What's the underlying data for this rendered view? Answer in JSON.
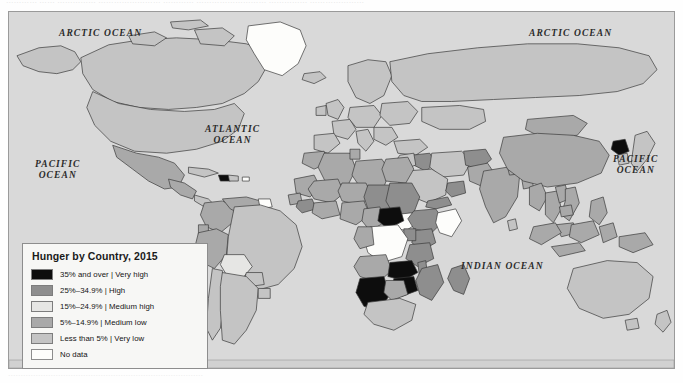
{
  "page": {
    "top_cut_text": "…………  ……  ……………  ……………………  …………  ………………………  ……………  …………………",
    "bottom_cut_text": "……………………………………………………………………"
  },
  "map": {
    "background_color": "#d9d9d9",
    "border_color": "#9a9a9a",
    "country_outline_color": "#3a3a3a",
    "ocean_labels": [
      {
        "name": "arctic-ocean-left",
        "text": "ARCTIC OCEAN",
        "x": 50,
        "y": 16
      },
      {
        "name": "arctic-ocean-right",
        "text": "ARCTIC OCEAN",
        "x": 520,
        "y": 16
      },
      {
        "name": "atlantic-ocean",
        "text": "ATLANTIC\nOCEAN",
        "x": 196,
        "y": 112
      },
      {
        "name": "pacific-ocean-left",
        "text": "PACIFIC\nOCEAN",
        "x": 26,
        "y": 147
      },
      {
        "name": "pacific-ocean-right",
        "text": "PACIFIC\nOCEAN",
        "x": 604,
        "y": 142
      },
      {
        "name": "indian-ocean",
        "text": "INDIAN OCEAN",
        "x": 452,
        "y": 249
      }
    ]
  },
  "legend": {
    "title": "Hunger by Country, 2015",
    "items": [
      {
        "label": "35% and over | Very high",
        "color": "#0d0d0d",
        "class_name": "very-high"
      },
      {
        "label": "25%–34.9% | High",
        "color": "#8e8e8e",
        "class_name": "high"
      },
      {
        "label": "15%–24.9% | Medium high",
        "color": "#e6e6e4",
        "class_name": "medium-high"
      },
      {
        "label": "5%–14.9% | Medium low",
        "color": "#a9a9a9",
        "class_name": "medium-low"
      },
      {
        "label": "Less than 5% | Very low",
        "color": "#c4c4c4",
        "class_name": "very-low"
      },
      {
        "label": "No data",
        "color": "#fdfdfb",
        "class_name": "no-data"
      }
    ]
  },
  "chart_data": {
    "type": "map",
    "title": "Hunger by Country, 2015",
    "measure": "Prevalence of undernourishment (share of population)",
    "categories": [
      "35% and over | Very high",
      "25%–34.9% | High",
      "15%–24.9% | Medium high",
      "5%–14.9% | Medium low",
      "Less than 5% | Very low",
      "No data"
    ],
    "category_colors": [
      "#0d0d0d",
      "#8e8e8e",
      "#e6e6e4",
      "#a9a9a9",
      "#c4c4c4",
      "#fdfdfb"
    ],
    "regions": [
      {
        "name": "Canada",
        "category": "Less than 5% | Very low"
      },
      {
        "name": "United States",
        "category": "Less than 5% | Very low"
      },
      {
        "name": "Greenland",
        "category": "No data"
      },
      {
        "name": "Mexico",
        "category": "5%–14.9% | Medium low"
      },
      {
        "name": "Guatemala",
        "category": "5%–14.9% | Medium low"
      },
      {
        "name": "Haiti",
        "category": "35% and over | Very high"
      },
      {
        "name": "Cuba",
        "category": "Less than 5% | Very low"
      },
      {
        "name": "Colombia",
        "category": "5%–14.9% | Medium low"
      },
      {
        "name": "Venezuela",
        "category": "5%–14.9% | Medium low"
      },
      {
        "name": "Peru",
        "category": "5%–14.9% | Medium low"
      },
      {
        "name": "Bolivia",
        "category": "15%–24.9% | Medium high"
      },
      {
        "name": "Brazil",
        "category": "Less than 5% | Very low"
      },
      {
        "name": "Argentina",
        "category": "Less than 5% | Very low"
      },
      {
        "name": "Chile",
        "category": "Less than 5% | Very low"
      },
      {
        "name": "Guyana",
        "category": "No data"
      },
      {
        "name": "Western Europe",
        "category": "Less than 5% | Very low"
      },
      {
        "name": "Russia",
        "category": "Less than 5% | Very low"
      },
      {
        "name": "Morocco",
        "category": "5%–14.9% | Medium low"
      },
      {
        "name": "Algeria",
        "category": "5%–14.9% | Medium low"
      },
      {
        "name": "Libya",
        "category": "5%–14.9% | Medium low"
      },
      {
        "name": "Egypt",
        "category": "5%–14.9% | Medium low"
      },
      {
        "name": "Sudan",
        "category": "25%–34.9% | High"
      },
      {
        "name": "Mali",
        "category": "5%–14.9% | Medium low"
      },
      {
        "name": "Niger",
        "category": "5%–14.9% | Medium low"
      },
      {
        "name": "Chad",
        "category": "25%–34.9% | High"
      },
      {
        "name": "Nigeria",
        "category": "5%–14.9% | Medium low"
      },
      {
        "name": "Ethiopia",
        "category": "25%–34.9% | High"
      },
      {
        "name": "Somalia",
        "category": "No data"
      },
      {
        "name": "Kenya",
        "category": "25%–34.9% | High"
      },
      {
        "name": "Uganda",
        "category": "25%–34.9% | High"
      },
      {
        "name": "Tanzania",
        "category": "25%–34.9% | High"
      },
      {
        "name": "Central African Republic",
        "category": "35% and over | Very high"
      },
      {
        "name": "Democratic Republic of the Congo",
        "category": "No data"
      },
      {
        "name": "Angola",
        "category": "5%–14.9% | Medium low"
      },
      {
        "name": "Zambia",
        "category": "35% and over | Very high"
      },
      {
        "name": "Zimbabwe",
        "category": "35% and over | Very high"
      },
      {
        "name": "Namibia",
        "category": "35% and over | Very high"
      },
      {
        "name": "Mozambique",
        "category": "25%–34.9% | High"
      },
      {
        "name": "Madagascar",
        "category": "25%–34.9% | High"
      },
      {
        "name": "South Africa",
        "category": "Less than 5% | Very low"
      },
      {
        "name": "Saudi Arabia",
        "category": "Less than 5% | Very low"
      },
      {
        "name": "Yemen",
        "category": "25%–34.9% | High"
      },
      {
        "name": "Iraq",
        "category": "25%–34.9% | High"
      },
      {
        "name": "Iran",
        "category": "Less than 5% | Very low"
      },
      {
        "name": "Afghanistan",
        "category": "25%–34.9% | High"
      },
      {
        "name": "Pakistan",
        "category": "5%–14.9% | Medium low"
      },
      {
        "name": "India",
        "category": "5%–14.9% | Medium low"
      },
      {
        "name": "China",
        "category": "5%–14.9% | Medium low"
      },
      {
        "name": "Mongolia",
        "category": "5%–14.9% | Medium low"
      },
      {
        "name": "North Korea",
        "category": "35% and over | Very high"
      },
      {
        "name": "Japan",
        "category": "Less than 5% | Very low"
      },
      {
        "name": "Laos",
        "category": "5%–14.9% | Medium low"
      },
      {
        "name": "Indonesia",
        "category": "5%–14.9% | Medium low"
      },
      {
        "name": "Australia",
        "category": "Less than 5% | Very low"
      },
      {
        "name": "New Zealand",
        "category": "Less than 5% | Very low"
      }
    ]
  }
}
